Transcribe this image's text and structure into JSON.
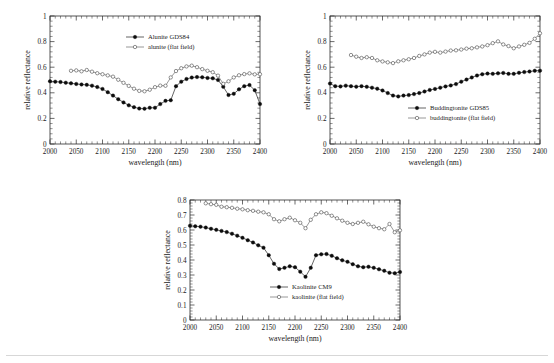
{
  "figure": {
    "background": "#ffffff",
    "panel_count": 3,
    "rule_color": "#d7d7d7"
  },
  "chart_data": [
    {
      "id": "alunite",
      "type": "line",
      "title": "",
      "xlabel": "wavelength (nm)",
      "ylabel": "relative reflectance",
      "xlim": [
        2000,
        2400
      ],
      "ylim": [
        0,
        1
      ],
      "xticks": [
        2000,
        2050,
        2100,
        2150,
        2200,
        2250,
        2300,
        2350,
        2400
      ],
      "xtick_labels": [
        "2000",
        "2050",
        "2100",
        "2150",
        "2200",
        "2250",
        "2300",
        "2350",
        "2400"
      ],
      "yticks": [
        0,
        0.2,
        0.4,
        0.6,
        0.8,
        1
      ],
      "ytick_labels": [
        "0",
        "0.2",
        "0.4",
        "0.6",
        "0.8",
        "1"
      ],
      "grid": false,
      "legend_position": "top-right",
      "series": [
        {
          "name": "Alunite GDS84",
          "marker": "filled-circle",
          "color": "#0c0c0c",
          "x": [
            2000,
            2010,
            2020,
            2030,
            2040,
            2050,
            2060,
            2070,
            2080,
            2090,
            2100,
            2110,
            2120,
            2130,
            2140,
            2150,
            2160,
            2170,
            2180,
            2190,
            2200,
            2210,
            2220,
            2230,
            2240,
            2250,
            2260,
            2270,
            2280,
            2290,
            2300,
            2310,
            2320,
            2330,
            2340,
            2350,
            2360,
            2370,
            2380,
            2390,
            2400
          ],
          "values": [
            0.49,
            0.487,
            0.484,
            0.479,
            0.474,
            0.469,
            0.465,
            0.462,
            0.456,
            0.445,
            0.43,
            0.405,
            0.378,
            0.35,
            0.325,
            0.302,
            0.288,
            0.277,
            0.276,
            0.283,
            0.283,
            0.312,
            0.337,
            0.342,
            0.452,
            0.487,
            0.508,
            0.519,
            0.523,
            0.521,
            0.516,
            0.513,
            0.5,
            0.447,
            0.383,
            0.392,
            0.427,
            0.452,
            0.46,
            0.42,
            0.312
          ]
        },
        {
          "name": "alunite (flat field)",
          "marker": "open-circle",
          "color": "#3a3a3a",
          "x": [
            2040,
            2050,
            2060,
            2070,
            2080,
            2090,
            2100,
            2110,
            2120,
            2130,
            2140,
            2150,
            2160,
            2170,
            2180,
            2190,
            2200,
            2210,
            2220,
            2230,
            2240,
            2250,
            2260,
            2270,
            2280,
            2290,
            2300,
            2310,
            2320,
            2330,
            2340,
            2350,
            2360,
            2370,
            2380,
            2390,
            2400
          ],
          "values": [
            0.572,
            0.575,
            0.568,
            0.578,
            0.565,
            0.553,
            0.545,
            0.536,
            0.526,
            0.502,
            0.478,
            0.454,
            0.432,
            0.415,
            0.412,
            0.424,
            0.444,
            0.456,
            0.455,
            0.52,
            0.57,
            0.592,
            0.606,
            0.612,
            0.6,
            0.585,
            0.572,
            0.561,
            0.534,
            0.47,
            0.49,
            0.52,
            0.537,
            0.546,
            0.552,
            0.544,
            0.545
          ]
        }
      ]
    },
    {
      "id": "buddingtonite",
      "type": "line",
      "title": "",
      "xlabel": "wavelength (nm)",
      "ylabel": "relative reflectance",
      "xlim": [
        2000,
        2400
      ],
      "ylim": [
        0,
        1
      ],
      "xticks": [
        2000,
        2050,
        2100,
        2150,
        2200,
        2250,
        2300,
        2350,
        2400
      ],
      "xtick_labels": [
        "2000",
        "2050",
        "2100",
        "2150",
        "2200",
        "2250",
        "2300",
        "2350",
        "2400"
      ],
      "yticks": [
        0,
        0.2,
        0.4,
        0.6,
        0.8,
        1
      ],
      "ytick_labels": [
        "0",
        "0.2",
        "0.4",
        "0.6",
        "0.8",
        "1"
      ],
      "grid": false,
      "legend_position": "bottom-right",
      "series": [
        {
          "name": "Buddingtonite GDS85",
          "marker": "filled-circle",
          "color": "#0c0c0c",
          "x": [
            2000,
            2010,
            2020,
            2030,
            2040,
            2050,
            2060,
            2070,
            2080,
            2090,
            2100,
            2110,
            2120,
            2130,
            2140,
            2150,
            2160,
            2170,
            2180,
            2190,
            2200,
            2210,
            2220,
            2230,
            2240,
            2250,
            2260,
            2270,
            2280,
            2290,
            2300,
            2310,
            2320,
            2330,
            2340,
            2350,
            2360,
            2370,
            2380,
            2390,
            2400
          ],
          "values": [
            0.472,
            0.452,
            0.45,
            0.456,
            0.452,
            0.448,
            0.452,
            0.447,
            0.44,
            0.432,
            0.418,
            0.398,
            0.378,
            0.372,
            0.378,
            0.382,
            0.39,
            0.398,
            0.41,
            0.422,
            0.43,
            0.44,
            0.45,
            0.458,
            0.468,
            0.487,
            0.503,
            0.52,
            0.535,
            0.545,
            0.55,
            0.548,
            0.552,
            0.555,
            0.548,
            0.548,
            0.556,
            0.562,
            0.566,
            0.572,
            0.573
          ]
        },
        {
          "name": "buddingtonite (flat field)",
          "marker": "open-circle",
          "color": "#3a3a3a",
          "x": [
            2040,
            2050,
            2060,
            2070,
            2080,
            2090,
            2100,
            2110,
            2120,
            2130,
            2140,
            2150,
            2160,
            2170,
            2180,
            2190,
            2200,
            2210,
            2220,
            2230,
            2240,
            2250,
            2260,
            2270,
            2280,
            2290,
            2300,
            2310,
            2320,
            2330,
            2340,
            2350,
            2360,
            2370,
            2380,
            2390,
            2400
          ],
          "values": [
            0.695,
            0.682,
            0.672,
            0.678,
            0.672,
            0.654,
            0.645,
            0.638,
            0.632,
            0.646,
            0.654,
            0.662,
            0.672,
            0.688,
            0.7,
            0.714,
            0.72,
            0.714,
            0.722,
            0.73,
            0.732,
            0.738,
            0.745,
            0.748,
            0.755,
            0.762,
            0.772,
            0.788,
            0.802,
            0.778,
            0.765,
            0.748,
            0.762,
            0.775,
            0.79,
            0.822,
            0.865
          ]
        }
      ]
    },
    {
      "id": "kaolinite",
      "type": "line",
      "title": "",
      "xlabel": "wavelength (nm)",
      "ylabel": "relative reflectance",
      "xlim": [
        2000,
        2400
      ],
      "ylim": [
        0,
        0.8
      ],
      "xticks": [
        2000,
        2050,
        2100,
        2150,
        2200,
        2250,
        2300,
        2350,
        2400
      ],
      "xtick_labels": [
        "2000",
        "2050",
        "2100",
        "2150",
        "2200",
        "2250",
        "2300",
        "2350",
        "2400"
      ],
      "yticks": [
        0,
        0.1,
        0.2,
        0.3,
        0.4,
        0.5,
        0.6,
        0.7,
        0.8
      ],
      "ytick_labels": [
        "0",
        "0.1",
        "0.2",
        "0.3",
        "0.4",
        "0.5",
        "0.6",
        "0.7",
        "0.8"
      ],
      "grid": false,
      "legend_position": "bottom-right",
      "series": [
        {
          "name": "Kaolinite CM9",
          "marker": "filled-circle",
          "color": "#0c0c0c",
          "x": [
            2000,
            2010,
            2020,
            2030,
            2040,
            2050,
            2060,
            2070,
            2080,
            2090,
            2100,
            2110,
            2120,
            2130,
            2140,
            2150,
            2160,
            2170,
            2180,
            2190,
            2200,
            2210,
            2220,
            2230,
            2240,
            2250,
            2260,
            2270,
            2280,
            2290,
            2300,
            2310,
            2320,
            2330,
            2340,
            2350,
            2360,
            2370,
            2380,
            2390,
            2400
          ],
          "values": [
            0.628,
            0.625,
            0.622,
            0.616,
            0.608,
            0.601,
            0.594,
            0.586,
            0.575,
            0.562,
            0.548,
            0.532,
            0.517,
            0.498,
            0.482,
            0.432,
            0.375,
            0.34,
            0.348,
            0.358,
            0.352,
            0.322,
            0.288,
            0.348,
            0.432,
            0.438,
            0.44,
            0.428,
            0.412,
            0.398,
            0.388,
            0.372,
            0.358,
            0.352,
            0.355,
            0.348,
            0.338,
            0.328,
            0.315,
            0.312,
            0.32
          ]
        },
        {
          "name": "kaolinite (flat field)",
          "marker": "open-circle",
          "color": "#3a3a3a",
          "x": [
            2030,
            2040,
            2050,
            2060,
            2070,
            2080,
            2090,
            2100,
            2110,
            2120,
            2130,
            2140,
            2150,
            2160,
            2170,
            2180,
            2190,
            2200,
            2210,
            2220,
            2230,
            2240,
            2250,
            2260,
            2270,
            2280,
            2290,
            2300,
            2310,
            2320,
            2330,
            2340,
            2350,
            2360,
            2370,
            2380,
            2390,
            2400
          ],
          "values": [
            0.778,
            0.772,
            0.768,
            0.755,
            0.752,
            0.748,
            0.742,
            0.738,
            0.732,
            0.728,
            0.722,
            0.718,
            0.705,
            0.672,
            0.658,
            0.672,
            0.682,
            0.665,
            0.648,
            0.612,
            0.668,
            0.705,
            0.718,
            0.712,
            0.695,
            0.678,
            0.662,
            0.648,
            0.64,
            0.648,
            0.655,
            0.638,
            0.622,
            0.612,
            0.605,
            0.64,
            0.585,
            0.598
          ]
        }
      ]
    }
  ]
}
